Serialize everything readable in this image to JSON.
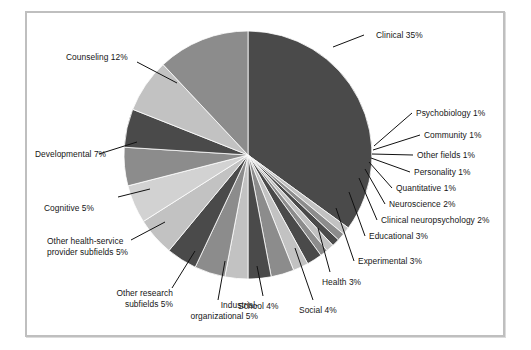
{
  "figure": {
    "kind": "pie-chart-figure",
    "background_color": "#ffffff",
    "frame_border_color": "#bfbfbf"
  },
  "chart_data": {
    "type": "pie",
    "title": "",
    "subtitle": "",
    "xlabel": "",
    "ylabel": "",
    "grid": false,
    "legend_position": "none",
    "label_format": "{name} {value}%",
    "units": "percent",
    "start_angle_deg": 0,
    "direction": "clockwise",
    "categories": [
      "Clinical",
      "Psychobiology",
      "Community",
      "Other fields",
      "Personality",
      "Quantitative",
      "Neuroscience",
      "Clinical neuropsychology",
      "Educational",
      "Experimental",
      "Health",
      "Social",
      "School",
      "Industrial-organizational",
      "Other research subfields",
      "Other health-service provider subfields",
      "Cognitive",
      "Developmental",
      "Counseling"
    ],
    "values": [
      35,
      1,
      1,
      1,
      1,
      1,
      2,
      2,
      3,
      3,
      3,
      4,
      4,
      5,
      5,
      5,
      5,
      7,
      12
    ],
    "colors": [
      "#4a4a4a",
      "#c2c2c2",
      "#8c8c8c",
      "#4a4a4a",
      "#c2c2c2",
      "#8c8c8c",
      "#4a4a4a",
      "#c2c2c2",
      "#8c8c8c",
      "#4a4a4a",
      "#c2c2c2",
      "#8c8c8c",
      "#4a4a4a",
      "#c2c2c2",
      "#d2d2d2",
      "#8c8c8c",
      "#4a4a4a",
      "#c2c2c2",
      "#8c8c8c"
    ],
    "slices": [
      {
        "name": "Clinical",
        "value": 35,
        "label": "Clinical 35%",
        "color": "#4a4a4a"
      },
      {
        "name": "Psychobiology",
        "value": 1,
        "label": "Psychobiology 1%",
        "color": "#c2c2c2"
      },
      {
        "name": "Community",
        "value": 1,
        "label": "Community 1%",
        "color": "#8c8c8c"
      },
      {
        "name": "Other fields",
        "value": 1,
        "label": "Other fields 1%",
        "color": "#4a4a4a"
      },
      {
        "name": "Personality",
        "value": 1,
        "label": "Personality 1%",
        "color": "#c2c2c2"
      },
      {
        "name": "Quantitative",
        "value": 1,
        "label": "Quantitative 1%",
        "color": "#8c8c8c"
      },
      {
        "name": "Neuroscience",
        "value": 2,
        "label": "Neuroscience 2%",
        "color": "#4a4a4a"
      },
      {
        "name": "Clinical neuropsychology",
        "value": 2,
        "label": "Clinical neuropsychology 2%",
        "color": "#c2c2c2"
      },
      {
        "name": "Educational",
        "value": 3,
        "label": "Educational 3%",
        "color": "#8c8c8c"
      },
      {
        "name": "Experimental",
        "value": 3,
        "label": "Experimental 3%",
        "color": "#4a4a4a"
      },
      {
        "name": "Health",
        "value": 3,
        "label": "Health 3%",
        "color": "#c2c2c2"
      },
      {
        "name": "Social",
        "value": 4,
        "label": "Social 4%",
        "color": "#8c8c8c"
      },
      {
        "name": "School",
        "value": 4,
        "label": "School 4%",
        "color": "#4a4a4a"
      },
      {
        "name": "Industrial-organizational",
        "value": 5,
        "label": "Industrial-\norganizational 5%",
        "color": "#c2c2c2"
      },
      {
        "name": "Other research subfields",
        "value": 5,
        "label": "Other research\nsubfields 5%",
        "color": "#d2d2d2"
      },
      {
        "name": "Other health-service provider subfields",
        "value": 5,
        "label": "Other health-service\nprovider subfields 5%",
        "color": "#8c8c8c"
      },
      {
        "name": "Cognitive",
        "value": 5,
        "label": "Cognitive 5%",
        "color": "#4a4a4a"
      },
      {
        "name": "Developmental",
        "value": 7,
        "label": "Developmental 7%",
        "color": "#c2c2c2"
      },
      {
        "name": "Counseling",
        "value": 12,
        "label": "Counseling 12%",
        "color": "#8c8c8c"
      }
    ]
  },
  "labels": {
    "clinical": "Clinical 35%",
    "psychobiology": "Psychobiology 1%",
    "community": "Community 1%",
    "other_fields": "Other fields 1%",
    "personality": "Personality 1%",
    "quantitative": "Quantitative 1%",
    "neuroscience": "Neuroscience 2%",
    "clinical_neuropsychology": "Clinical neuropsychology 2%",
    "educational": "Educational 3%",
    "experimental": "Experimental 3%",
    "health": "Health 3%",
    "social": "Social 4%",
    "school": "School 4%",
    "industrial_organizational_line1": "Industrial-",
    "industrial_organizational_line2": "organizational 5%",
    "other_research_line1": "Other research",
    "other_research_line2": "subfields 5%",
    "other_health_service_line1": "Other health-service",
    "other_health_service_line2": "provider subfields 5%",
    "cognitive": "Cognitive 5%",
    "developmental": "Developmental 7%",
    "counseling": "Counseling 12%"
  }
}
